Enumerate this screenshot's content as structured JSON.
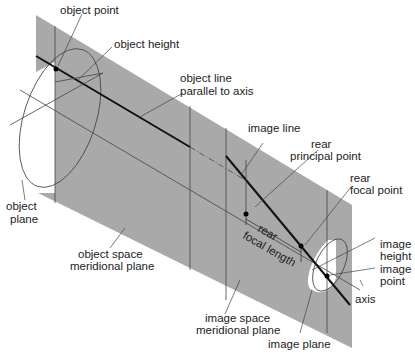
{
  "diagram": {
    "colors": {
      "plane": "#a9a9a9",
      "line": "#333333",
      "axis_line": "#111111",
      "background": "#ffffff"
    },
    "labels": {
      "object_point": "object point",
      "object_height": "object height",
      "object_line_1": "object line",
      "object_line_2": "parallel to axis",
      "object_plane_1": "object",
      "object_plane_2": "plane",
      "image_line": "image line",
      "rear_principal_1": "rear",
      "rear_principal_2": "principal point",
      "rear_focal_1": "rear",
      "rear_focal_2": "focal point",
      "rear_focal_length_1": "rear",
      "rear_focal_length_2": "focal length",
      "object_space_1": "object space",
      "object_space_2": "meridional plane",
      "image_height_1": "image",
      "image_height_2": "height",
      "image_point_1": "image",
      "image_point_2": "point",
      "axis": "axis",
      "image_space_1": "image space",
      "image_space_2": "meridional plane",
      "image_plane": "image plane"
    }
  }
}
